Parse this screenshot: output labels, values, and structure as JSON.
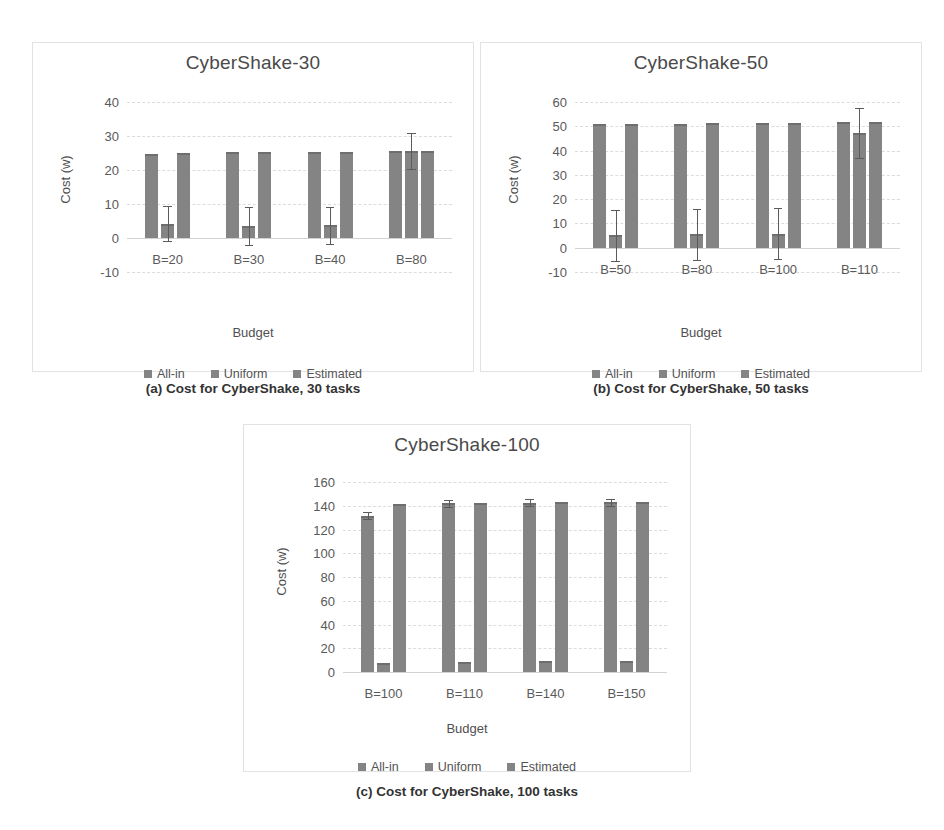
{
  "figure": {
    "series_names": [
      "All-in",
      "Uniform",
      "Estimated"
    ],
    "bar_color": "#848484",
    "grid_color": "#dcdcdc",
    "panel_border_color": "#e2e2e2"
  },
  "captions": {
    "a": "(a) Cost for CyberShake, 30 tasks",
    "b": "(b) Cost for CyberShake, 50 tasks",
    "c": "(c) Cost for CyberShake, 100 tasks"
  },
  "chart_data": [
    {
      "id": "cybershake-30",
      "type": "bar",
      "title": "CyberShake-30",
      "xlabel": "Budget",
      "ylabel": "Cost (w)",
      "categories": [
        "B=20",
        "B=30",
        "B=40",
        "B=80"
      ],
      "yticks": [
        40,
        30,
        20,
        10,
        0,
        -10
      ],
      "ylim": [
        -10,
        40
      ],
      "grid": true,
      "legend": [
        "All-in",
        "Uniform",
        "Estimated"
      ],
      "legend_position": "bottom",
      "series": [
        {
          "name": "All-in",
          "values": [
            24.8,
            25.2,
            25.2,
            25.5
          ],
          "errors": [
            0,
            0,
            0,
            0
          ]
        },
        {
          "name": "Uniform",
          "values": [
            4.2,
            3.5,
            3.7,
            25.6
          ],
          "errors": [
            5.2,
            5.6,
            5.5,
            5.3
          ]
        },
        {
          "name": "Estimated",
          "values": [
            25.0,
            25.3,
            25.4,
            25.6
          ],
          "errors": [
            0,
            0,
            0,
            0
          ]
        }
      ]
    },
    {
      "id": "cybershake-50",
      "type": "bar",
      "title": "CyberShake-50",
      "xlabel": "Budget",
      "ylabel": "Cost (w)",
      "categories": [
        "B=50",
        "B=80",
        "B=100",
        "B=110"
      ],
      "yticks": [
        60,
        50,
        40,
        30,
        20,
        10,
        0,
        -10
      ],
      "ylim": [
        -10,
        60
      ],
      "grid": true,
      "legend": [
        "All-in",
        "Uniform",
        "Estimated"
      ],
      "legend_position": "bottom",
      "series": [
        {
          "name": "All-in",
          "values": [
            50.8,
            51.0,
            51.2,
            51.6
          ],
          "errors": [
            0,
            0,
            0,
            0
          ]
        },
        {
          "name": "Uniform",
          "values": [
            5.2,
            5.5,
            5.8,
            47.3
          ],
          "errors": [
            10.5,
            10.6,
            10.4,
            10.2
          ]
        },
        {
          "name": "Estimated",
          "values": [
            50.9,
            51.3,
            51.5,
            51.7
          ],
          "errors": [
            0,
            0,
            0,
            0
          ]
        }
      ]
    },
    {
      "id": "cybershake-100",
      "type": "bar",
      "title": "CyberShake-100",
      "xlabel": "Budget",
      "ylabel": "Cost (w)",
      "categories": [
        "B=100",
        "B=110",
        "B=140",
        "B=150"
      ],
      "yticks": [
        160,
        140,
        120,
        100,
        80,
        60,
        40,
        20,
        0
      ],
      "ylim": [
        0,
        160
      ],
      "grid": true,
      "legend": [
        "All-in",
        "Uniform",
        "Estimated"
      ],
      "legend_position": "bottom",
      "series": [
        {
          "name": "All-in",
          "values": [
            131.5,
            142.0,
            142.5,
            143.0
          ],
          "errors": [
            3.0,
            3.0,
            3.0,
            3.0
          ]
        },
        {
          "name": "Uniform",
          "values": [
            8.0,
            8.5,
            9.0,
            9.5
          ],
          "errors": [
            0,
            0,
            0,
            0
          ]
        },
        {
          "name": "Estimated",
          "values": [
            141.5,
            142.3,
            143.0,
            143.5
          ],
          "errors": [
            0,
            0,
            0,
            0
          ]
        }
      ]
    }
  ]
}
